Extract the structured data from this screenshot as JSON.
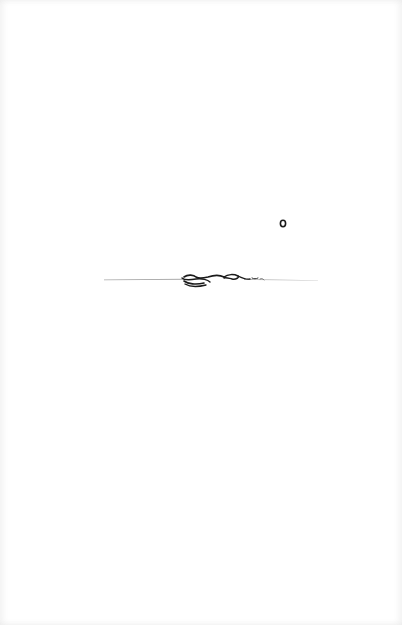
{
  "page": {
    "background": "#ffffff",
    "ink_color": "#1a1a1a",
    "rule_color": "#9a9a9a"
  },
  "ornaments": [
    {
      "name": "small-ring-ornament",
      "x": 283,
      "y": 223
    },
    {
      "name": "scrollwork-divider",
      "x": 104,
      "y": 280,
      "width": 214
    }
  ]
}
